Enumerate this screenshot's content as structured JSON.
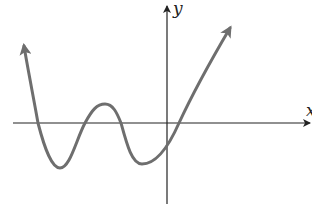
{
  "figure": {
    "type": "function-graph",
    "axes": {
      "x_label": "x",
      "y_label": "y"
    },
    "curve": {
      "description": "Polynomial-like curve with arrows at both ends; rises steeply on left and right",
      "color": "#6e6e6e",
      "x_intercepts_px": [
        38,
        85,
        121,
        179
      ],
      "local_minima_px": [
        [
          60,
          168
        ],
        [
          140,
          164
        ]
      ],
      "local_maxima_px": [
        [
          105,
          104
        ]
      ],
      "y_intercept_px": [
        167,
        141
      ]
    },
    "axis_color": "#222222"
  }
}
